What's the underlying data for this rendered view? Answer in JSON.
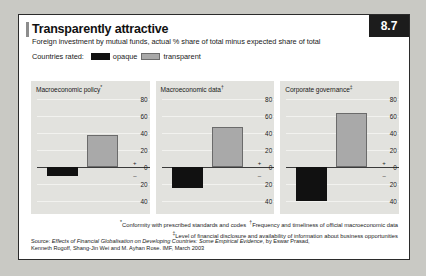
{
  "header": {
    "title": "Transparently attractive",
    "subtitle": "Foreign investment by mutual funds, actual % share of total minus expected share of total",
    "badge": "8.7"
  },
  "legend": {
    "label": "Countries rated:",
    "entries": [
      {
        "name": "opaque",
        "label": "opaque",
        "color": "#111111"
      },
      {
        "name": "transparent",
        "label": "transparent",
        "color": "#a9a9a9"
      }
    ]
  },
  "footnotes": {
    "line1_marker": "*",
    "line1": "Conformity with prescribed standards and codes",
    "line1b_marker": "†",
    "line1b": "Frequency and timeliness of official macroeconomic data",
    "line2_marker": "‡",
    "line2": "Level of financial disclosure and availability of information about business opportunities"
  },
  "source": {
    "prefix": "Source: ",
    "italic": "Effects of Financial Globalisation on Developing Countries: Some Empirical Evidence",
    "suffix": ", by Eswar Prasad, Kenneth Rogoff, Shang-Jin Wei and M. Ayhan Rose. IMF, March 2003"
  },
  "chart_data": {
    "type": "bar",
    "title": "Transparently attractive",
    "subtitle": "Foreign investment by mutual funds, actual % share of total minus expected share of total",
    "ylabel": "",
    "xlabel": "",
    "ylim": [
      -50,
      85
    ],
    "yticks": [
      80,
      60,
      40,
      20,
      0,
      -20,
      -40
    ],
    "ytick_labels": [
      "80",
      "60",
      "40",
      "20",
      "0",
      "20",
      "40"
    ],
    "grid": true,
    "legend_position": "top",
    "categories": [
      "opaque",
      "transparent"
    ],
    "panels": [
      {
        "title": "Macroeconomic policy",
        "marker": "*",
        "values": [
          -10,
          38
        ]
      },
      {
        "title": "Macroeconomic data",
        "marker": "†",
        "values": [
          -24,
          48
        ]
      },
      {
        "title": "Corporate governance",
        "marker": "‡",
        "values": [
          -40,
          64
        ]
      }
    ]
  }
}
